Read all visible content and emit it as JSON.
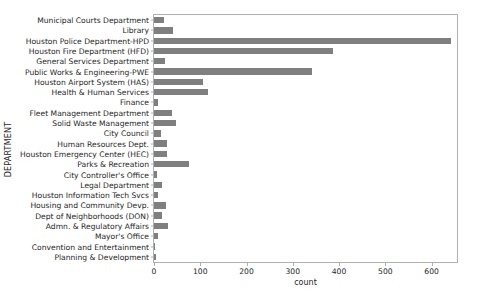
{
  "chart_data": {
    "type": "bar",
    "orientation": "horizontal",
    "title": "",
    "xlabel": "count",
    "ylabel": "DEPARTMENT",
    "xlim": [
      0,
      655
    ],
    "ylim": null,
    "grid": false,
    "legend": null,
    "bar_color": "#7f7f7f",
    "xticks": [
      0,
      100,
      200,
      300,
      400,
      500,
      600
    ],
    "xtick_labels": [
      "0",
      "100",
      "200",
      "300",
      "400",
      "500",
      "600"
    ],
    "categories": [
      "Municipal Courts Department",
      "Library",
      "Houston Police Department-HPD",
      "Houston Fire Department (HFD)",
      "General Services Department",
      "Public Works & Engineering-PWE",
      "Houston Airport System (HAS)",
      "Health & Human Services",
      "Finance",
      "Fleet Management Department",
      "Solid Waste Management",
      "City Council",
      "Human Resources Dept.",
      "Houston Emergency Center (HEC)",
      "Parks & Recreation",
      "City Controller's Office",
      "Legal Department",
      "Houston Information Tech Svcs",
      "Housing and Community Devp.",
      "Dept of Neighborhoods (DON)",
      "Admn. & Regulatory Affairs",
      "Mayor's Office",
      "Convention and Entertainment",
      "Planning & Development"
    ],
    "values": [
      21,
      40,
      641,
      387,
      24,
      342,
      107,
      116,
      9,
      39,
      47,
      15,
      28,
      28,
      75,
      7,
      18,
      9,
      25,
      18,
      30,
      9,
      3,
      5
    ]
  }
}
